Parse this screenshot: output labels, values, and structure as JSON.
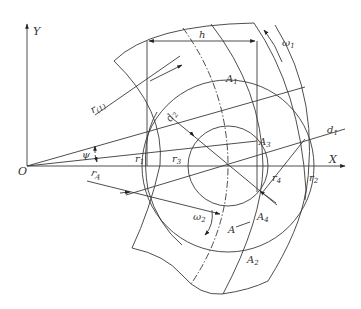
{
  "figure": {
    "type": "geometric-kinematics-diagram",
    "background": "#ffffff",
    "line_color": "#3a3a3a"
  },
  "axes": {
    "x_label": "X",
    "y_label": "Y",
    "origin_label": "O"
  },
  "labels": {
    "h": "h",
    "omega1": "ω",
    "omega1_sub": "1",
    "omega2": "ω",
    "omega2_sub": "2",
    "A1": "A",
    "A1_sub": "1",
    "A2": "A",
    "A2_sub": "2",
    "A3": "A",
    "A3_sub": "3",
    "A4": "A",
    "A4_sub": "4",
    "A": "A",
    "d1": "d",
    "d1_sub": "1",
    "d2": "d",
    "d2_sub": "2",
    "r_phi": "r",
    "r_phi_sub": "(1)",
    "r1": "r",
    "r1_sub": "1",
    "r2": "r",
    "r2_sub": "2",
    "r3": "r",
    "r3_sub": "3",
    "r4": "r",
    "r4_sub": "4",
    "rA": "r",
    "rA_sub": "A",
    "psi": "ψ"
  }
}
